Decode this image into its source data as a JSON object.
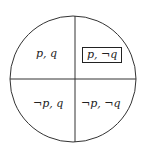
{
  "diagram": {
    "type": "circle-quadrants",
    "quadrants": {
      "top_left": {
        "label": "p, q",
        "highlighted": false
      },
      "top_right": {
        "label": "p, ¬q",
        "highlighted": true
      },
      "bottom_left": {
        "label": "¬p, q",
        "highlighted": false
      },
      "bottom_right": {
        "label": "¬p, ¬q",
        "highlighted": false
      }
    },
    "stroke_color": "#333333"
  }
}
